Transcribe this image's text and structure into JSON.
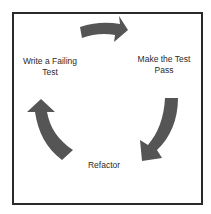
{
  "diagram": {
    "type": "cycle",
    "steps": [
      {
        "label_line1": "Write a Failing",
        "label_line2": "Test"
      },
      {
        "label_line1": "Make the Test",
        "label_line2": "Pass"
      },
      {
        "label_line1": "Refactor"
      }
    ],
    "arrow_color": "#555555",
    "frame_color": "#2a2a2a"
  }
}
